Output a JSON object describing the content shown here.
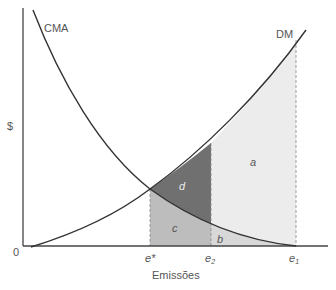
{
  "diagram": {
    "y_axis_label": "$",
    "x_axis_label": "Emissões",
    "origin_label": "0",
    "curves": {
      "cma": "CMA",
      "dm": "DM"
    },
    "x_ticks": {
      "e_star": "e*",
      "e2_base": "e",
      "e2_sub": "2",
      "e1_base": "e",
      "e1_sub": "1"
    },
    "regions": {
      "a": "a",
      "b": "b",
      "c": "c",
      "d": "d"
    },
    "colors": {
      "region_a": "#ececec",
      "region_b": "#dcdcdc",
      "region_c": "#bcbcbc",
      "region_d": "#6e6e6e",
      "curve": "#333333",
      "axis": "#444444"
    }
  }
}
